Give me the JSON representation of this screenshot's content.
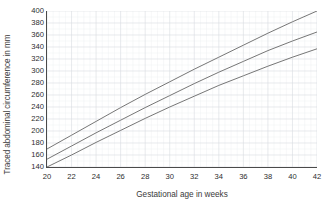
{
  "chart_data": {
    "type": "line",
    "title": "",
    "xlabel": "Gestational age in weeks",
    "ylabel": "Traced abdominal circumference in mm",
    "xlim": [
      20,
      42
    ],
    "ylim": [
      140,
      400
    ],
    "xticks": [
      20,
      22,
      24,
      26,
      28,
      30,
      32,
      34,
      36,
      38,
      40,
      42
    ],
    "yticks": [
      140,
      160,
      180,
      200,
      220,
      240,
      260,
      280,
      300,
      320,
      340,
      360,
      380,
      400
    ],
    "grid": true,
    "grid_minor": true,
    "legend": "none",
    "line_color": "#6f6f6f",
    "grid_color": "#d8dce0",
    "grid_minor_color": "#eef1f3",
    "axis_color": "#4a4a4a",
    "x": [
      20,
      22,
      24,
      26,
      28,
      30,
      32,
      34,
      36,
      38,
      40,
      42
    ],
    "series": [
      {
        "name": "upper",
        "values": [
          170,
          193,
          216,
          239,
          261,
          282,
          303,
          323,
          343,
          363,
          382,
          400
        ]
      },
      {
        "name": "median",
        "values": [
          153,
          175,
          197,
          218,
          239,
          259,
          279,
          298,
          316,
          334,
          350,
          365
        ]
      },
      {
        "name": "lower",
        "values": [
          140,
          160,
          181,
          201,
          221,
          240,
          258,
          276,
          292,
          308,
          323,
          337
        ]
      }
    ]
  }
}
